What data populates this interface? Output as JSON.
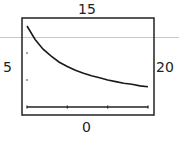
{
  "window": {
    "ymax_label": "15",
    "ymin_label": "0",
    "xmin_label": "5",
    "xmax_label": "20"
  },
  "colors": {
    "frame": "#222222",
    "curve": "#1a1a1a",
    "rule": "#c8c8c8"
  },
  "chart_data": {
    "type": "line",
    "title": "",
    "xlabel": "",
    "ylabel": "",
    "xlim": [
      5,
      20
    ],
    "ylim": [
      0,
      15
    ],
    "grid": false,
    "x_ticks": [
      5,
      10,
      15,
      20
    ],
    "y_ticks": [
      0,
      5,
      10,
      15
    ],
    "series": [
      {
        "name": "y = 75/x",
        "x": [
          5,
          6,
          7,
          8,
          9,
          10,
          11,
          12,
          13,
          14,
          15,
          16,
          17,
          18,
          19,
          20
        ],
        "values": [
          15,
          12.5,
          10.7,
          9.4,
          8.3,
          7.5,
          6.8,
          6.25,
          5.8,
          5.4,
          5,
          4.7,
          4.4,
          4.2,
          3.9,
          3.75
        ]
      }
    ],
    "annotations": [
      "15 (Ymax, top)",
      "0 (Ymin, bottom)",
      "5 (Xmin, left)",
      "20 (Xmax, right)"
    ]
  }
}
